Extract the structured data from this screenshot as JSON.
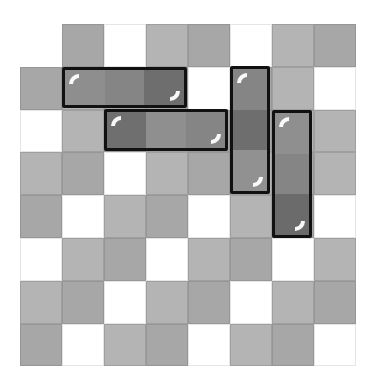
{
  "board": {
    "origin_x": 20,
    "origin_y": 24,
    "cell_w": 42,
    "cell_h": 42.8,
    "colors": {
      "W": "#ffffff",
      "L": "#b4b4b4",
      "M": "#a7a7a7"
    },
    "rows": [
      [
        "",
        "M",
        "W",
        "L",
        "M",
        "W",
        "L",
        "M"
      ],
      [
        "M",
        "L",
        "M",
        "M",
        "W",
        "M",
        "L",
        "W"
      ],
      [
        "W",
        "L",
        "M",
        "L",
        "M",
        "M",
        "L",
        "L"
      ],
      [
        "L",
        "M",
        "W",
        "L",
        "M",
        "L",
        "M",
        "L"
      ],
      [
        "M",
        "W",
        "L",
        "M",
        "W",
        "L",
        "M",
        "W"
      ],
      [
        "W",
        "L",
        "M",
        "W",
        "L",
        "M",
        "W",
        "L"
      ],
      [
        "L",
        "M",
        "W",
        "L",
        "M",
        "W",
        "L",
        "M"
      ],
      [
        "M",
        "W",
        "L",
        "M",
        "W",
        "L",
        "M",
        "W"
      ]
    ]
  },
  "blocks": [
    {
      "id": "block-a",
      "orientation": "horizontal",
      "row": 1,
      "col": 1,
      "length": 3,
      "x": 62,
      "y": 67,
      "w": 125,
      "h": 41,
      "shades": [
        "#8e8e8e",
        "#858585",
        "#6e6e6e"
      ]
    },
    {
      "id": "block-b",
      "orientation": "horizontal",
      "row": 2,
      "col": 2,
      "length": 3,
      "x": 104,
      "y": 109,
      "w": 124,
      "h": 42,
      "shades": [
        "#6f6f6f",
        "#8f8f8f",
        "#858585"
      ]
    },
    {
      "id": "block-c",
      "orientation": "vertical",
      "row": 1,
      "col": 5,
      "length": 3,
      "x": 230,
      "y": 66,
      "w": 40,
      "h": 128,
      "shades": [
        "#858585",
        "#6e6e6e",
        "#919191"
      ]
    },
    {
      "id": "block-d",
      "orientation": "vertical",
      "row": 2,
      "col": 6,
      "length": 3,
      "x": 272,
      "y": 110,
      "w": 40,
      "h": 128,
      "shades": [
        "#8f8f8f",
        "#858585",
        "#6b6b6b"
      ]
    }
  ]
}
